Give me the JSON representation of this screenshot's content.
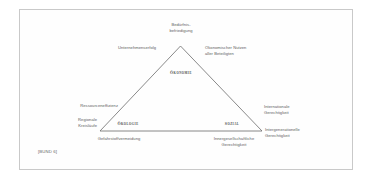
{
  "figure": {
    "type": "sustainability-triangle",
    "dimensions": [
      {
        "key": "oekonomie",
        "label": "Ökonomie"
      },
      {
        "key": "oekologie",
        "label": "Ökologie"
      },
      {
        "key": "sozial",
        "label": "Sozial"
      }
    ],
    "labels": {
      "apex_top": "Bedürfnis-\nbefriedigung",
      "upper_left": "Unternehmenserfolg",
      "upper_right": "Ökonomischer Nutzen\naller Beteiligten",
      "mid_left": "Ressourceneffizienz",
      "lower_left_outer": "Regionale\nKreisläufe",
      "mid_right": "Internationale\nGerechtigkeit",
      "lower_right_outer": "Intergenerationelle\nGerechtigkeit",
      "bottom_left": "Gefahrstoffvermeidung",
      "bottom_right": "Innergesellschaftliche\nGerechtigkeit"
    },
    "source": "[BUND 6]",
    "colors": {
      "frame": "#c9c9c9",
      "triangle_stroke": "#6b6b6b",
      "label_text": "#5d5d5d",
      "dimension_text": "#4a4a4a",
      "background": "#ffffff"
    }
  }
}
